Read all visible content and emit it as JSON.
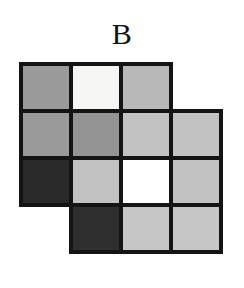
{
  "figure": {
    "label": "B",
    "type": "grid-shading-figure",
    "border_color": "#141414",
    "background_color": "#ffffff",
    "palette": {
      "white": "#ffffff",
      "near_white": "#f5f5f3",
      "light_gray": "#c2c2c2",
      "medium_gray": "#9a9a9a",
      "dark": "#2a2a2a"
    },
    "columns": 4,
    "rows": 4,
    "cells": [
      {
        "row": 0,
        "col": 0,
        "shade": "medium_gray",
        "color": "#9a9a9a",
        "present": true
      },
      {
        "row": 0,
        "col": 1,
        "shade": "near_white",
        "color": "#f5f5f3",
        "present": true
      },
      {
        "row": 0,
        "col": 2,
        "shade": "light_gray",
        "color": "#b8b8b8",
        "present": true
      },
      {
        "row": 0,
        "col": 3,
        "shade": "none",
        "color": "#ffffff",
        "present": false
      },
      {
        "row": 1,
        "col": 0,
        "shade": "medium_gray",
        "color": "#9a9a9a",
        "present": true
      },
      {
        "row": 1,
        "col": 1,
        "shade": "medium_gray",
        "color": "#949494",
        "present": true
      },
      {
        "row": 1,
        "col": 2,
        "shade": "light_gray",
        "color": "#c2c2c2",
        "present": true
      },
      {
        "row": 1,
        "col": 3,
        "shade": "light_gray",
        "color": "#c2c2c2",
        "present": true
      },
      {
        "row": 2,
        "col": 0,
        "shade": "dark",
        "color": "#2a2a2a",
        "present": true
      },
      {
        "row": 2,
        "col": 1,
        "shade": "light_gray",
        "color": "#c2c2c2",
        "present": true
      },
      {
        "row": 2,
        "col": 2,
        "shade": "white",
        "color": "#ffffff",
        "present": true
      },
      {
        "row": 2,
        "col": 3,
        "shade": "light_gray",
        "color": "#c2c2c2",
        "present": true
      },
      {
        "row": 3,
        "col": 0,
        "shade": "none",
        "color": "#ffffff",
        "present": false
      },
      {
        "row": 3,
        "col": 1,
        "shade": "dark",
        "color": "#2f2f2f",
        "present": true
      },
      {
        "row": 3,
        "col": 2,
        "shade": "light_gray",
        "color": "#c6c6c6",
        "present": true
      },
      {
        "row": 3,
        "col": 3,
        "shade": "light_gray",
        "color": "#c6c6c6",
        "present": true
      }
    ]
  }
}
